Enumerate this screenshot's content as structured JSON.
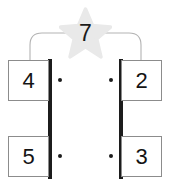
{
  "diagram": {
    "colors": {
      "card_border": "#8c8c8c",
      "rail": "#1c1c1c",
      "dot": "#1c1c1c",
      "star_fill": "#e9e9e9",
      "bracket_stroke": "#b3b3b3",
      "text": "#141414",
      "background": "#ffffff"
    },
    "star": {
      "icon": "star-icon",
      "value": "7"
    },
    "bracket": {
      "icon": "bracket-arc-icon"
    },
    "cards": [
      {
        "id": "card-top-left",
        "value": "4",
        "position": "top-left"
      },
      {
        "id": "card-top-right",
        "value": "2",
        "position": "top-right"
      },
      {
        "id": "card-bottom-left",
        "value": "5",
        "position": "bottom-left"
      },
      {
        "id": "card-bottom-right",
        "value": "3",
        "position": "bottom-right"
      }
    ],
    "rails": [
      {
        "id": "rail-left",
        "side": "left"
      },
      {
        "id": "rail-right",
        "side": "right"
      }
    ],
    "dots": [
      {
        "id": "dot-top-left"
      },
      {
        "id": "dot-top-right"
      },
      {
        "id": "dot-bottom-left"
      },
      {
        "id": "dot-bottom-right"
      }
    ]
  }
}
